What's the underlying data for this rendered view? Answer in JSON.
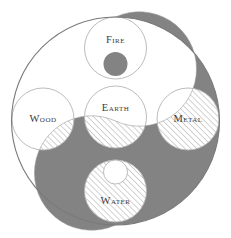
{
  "diagram": {
    "colors": {
      "background": "#ffffff",
      "dark": "#838383",
      "hatch_stroke": "#c4c4c4",
      "outline": "#b4b4b4",
      "outer_outline": "#7a7a7a",
      "label": "#3a3a3a"
    },
    "elements": [
      {
        "id": "fire",
        "label": "Fire",
        "cx": 115.5,
        "cy": 48,
        "r": 31,
        "label_x": 115.5,
        "label_y": 41,
        "inner_mark": {
          "type": "dark-dot",
          "cx": 115.5,
          "cy": 64,
          "r": 12
        }
      },
      {
        "id": "wood",
        "label": "Wood",
        "cx": 43,
        "cy": 119,
        "r": 31,
        "label_x": 43,
        "label_y": 120
      },
      {
        "id": "earth",
        "label": "Earth",
        "cx": 115.5,
        "cy": 117,
        "r": 31,
        "label_x": 115.5,
        "label_y": 109
      },
      {
        "id": "metal",
        "label": "Metal",
        "cx": 188,
        "cy": 119,
        "r": 31,
        "label_x": 188,
        "label_y": 120
      },
      {
        "id": "water",
        "label": "Water",
        "cx": 115.5,
        "cy": 191,
        "r": 31,
        "label_x": 115.5,
        "label_y": 202,
        "inner_mark": {
          "type": "light-dot",
          "cx": 115.5,
          "cy": 172,
          "r": 12
        }
      }
    ]
  }
}
